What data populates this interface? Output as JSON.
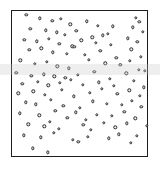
{
  "figure": {
    "title": "",
    "background_color": "#ffffff",
    "width": 160,
    "height": 175
  },
  "plot_frame": {
    "name": "square-plot-border",
    "border_color": "#1d1d1d",
    "border_width_px": 1.4,
    "left_px": 11,
    "top_px": 10,
    "width_px": 137,
    "height_px": 147
  },
  "marker_style": {
    "shape": "open-circle",
    "edge_color": "#2a2a2a",
    "fill_color": "#f2f2f2",
    "diameter_px": 3.4
  },
  "overlay": {
    "watermark_band_color": "#c8c8c8",
    "watermark_band_top_px": 64,
    "watermark_band_height_px": 11
  },
  "chart_data": {
    "type": "scatter",
    "title": "",
    "xlabel": "",
    "ylabel": "",
    "xlim": [
      0,
      1
    ],
    "ylim": [
      0,
      1
    ],
    "grid": false,
    "legend": null,
    "xticks": [],
    "yticks": [],
    "n_points": 122,
    "series": [
      {
        "name": "random-spatial-points",
        "marker": "o",
        "x": [
          0.105,
          0.205,
          0.295,
          0.355,
          0.425,
          0.545,
          0.625,
          0.735,
          0.905,
          0.93,
          0.135,
          0.245,
          0.325,
          0.385,
          0.47,
          0.585,
          0.665,
          0.7,
          0.88,
          0.955,
          0.09,
          0.18,
          0.27,
          0.345,
          0.44,
          0.505,
          0.61,
          0.72,
          0.845,
          0.915,
          0.125,
          0.215,
          0.3,
          0.4,
          0.455,
          0.53,
          0.645,
          0.76,
          0.87,
          0.94,
          0.06,
          0.165,
          0.255,
          0.33,
          0.415,
          0.56,
          0.68,
          0.79,
          0.86,
          0.925,
          0.03,
          0.14,
          0.23,
          0.31,
          0.39,
          0.48,
          0.6,
          0.715,
          0.835,
          0.97,
          0.075,
          0.19,
          0.265,
          0.35,
          0.43,
          0.515,
          0.635,
          0.745,
          0.89,
          0.96,
          0.045,
          0.155,
          0.24,
          0.365,
          0.45,
          0.57,
          0.655,
          0.77,
          0.855,
          0.935,
          0.1,
          0.175,
          0.285,
          0.375,
          0.495,
          0.59,
          0.69,
          0.8,
          0.875,
          0.945,
          0.055,
          0.2,
          0.315,
          0.405,
          0.465,
          0.54,
          0.62,
          0.73,
          0.82,
          0.9,
          0.12,
          0.235,
          0.275,
          0.34,
          0.52,
          0.575,
          0.67,
          0.755,
          0.84,
          0.985,
          0.085,
          0.21,
          0.305,
          0.445,
          0.485,
          0.555,
          0.705,
          0.78,
          0.865,
          0.91,
          0.15,
          0.26
        ],
        "y": [
          0.975,
          0.95,
          0.935,
          0.945,
          0.91,
          0.93,
          0.9,
          0.895,
          0.955,
          0.925,
          0.88,
          0.87,
          0.855,
          0.84,
          0.865,
          0.82,
          0.835,
          0.845,
          0.89,
          0.86,
          0.805,
          0.795,
          0.81,
          0.775,
          0.76,
          0.8,
          0.785,
          0.77,
          0.815,
          0.79,
          0.735,
          0.745,
          0.72,
          0.71,
          0.755,
          0.7,
          0.73,
          0.68,
          0.74,
          0.69,
          0.665,
          0.64,
          0.655,
          0.625,
          0.61,
          0.67,
          0.645,
          0.635,
          0.66,
          0.6,
          0.58,
          0.56,
          0.57,
          0.555,
          0.545,
          0.565,
          0.585,
          0.54,
          0.575,
          0.595,
          0.505,
          0.52,
          0.495,
          0.51,
          0.53,
          0.5,
          0.515,
          0.49,
          0.525,
          0.48,
          0.44,
          0.455,
          0.43,
          0.465,
          0.42,
          0.445,
          0.47,
          0.435,
          0.46,
          0.425,
          0.38,
          0.365,
          0.395,
          0.355,
          0.34,
          0.385,
          0.37,
          0.36,
          0.39,
          0.35,
          0.305,
          0.29,
          0.32,
          0.275,
          0.31,
          0.26,
          0.295,
          0.285,
          0.315,
          0.27,
          0.23,
          0.215,
          0.245,
          0.2,
          0.225,
          0.19,
          0.24,
          0.21,
          0.235,
          0.22,
          0.155,
          0.14,
          0.17,
          0.125,
          0.11,
          0.145,
          0.135,
          0.16,
          0.105,
          0.15,
          0.065,
          0.04
        ]
      }
    ]
  }
}
